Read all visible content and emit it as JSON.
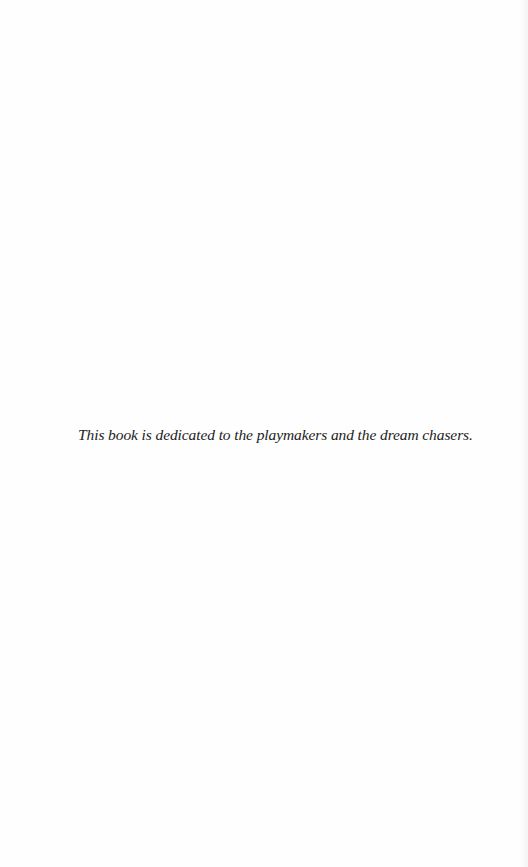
{
  "page": {
    "dedication": "This book is dedicated to the playmakers and the dream chasers."
  },
  "colors": {
    "background": "#fefefe",
    "text": "#222222"
  }
}
